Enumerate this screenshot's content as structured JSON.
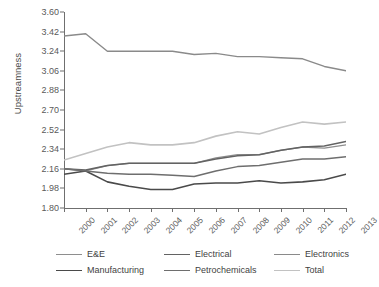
{
  "chart_data": {
    "type": "line",
    "title": "",
    "xlabel": "",
    "ylabel": "Upstreamness",
    "x": [
      2000,
      2001,
      2002,
      2003,
      2004,
      2005,
      2006,
      2007,
      2008,
      2009,
      2010,
      2011,
      2012,
      2013
    ],
    "xtick_labels": [
      "2000",
      "2001",
      "2002",
      "2003",
      "2004",
      "2005",
      "2006",
      "2007",
      "2008",
      "2009",
      "2010",
      "2011",
      "2012",
      "2013"
    ],
    "ytick_labels": [
      "1.80",
      "1.98",
      "2.16",
      "2.34",
      "2.52",
      "2.70",
      "2.88",
      "3.06",
      "3.24",
      "3.42",
      "3.60"
    ],
    "ytick_values": [
      1.8,
      1.98,
      2.16,
      2.34,
      2.52,
      2.7,
      2.88,
      3.06,
      3.24,
      3.42,
      3.6
    ],
    "ylim": [
      1.8,
      3.6
    ],
    "xlim": [
      2000,
      2013
    ],
    "grid": false,
    "legend_position": "bottom",
    "series": [
      {
        "name": "E&E",
        "color": "#8e8e8e",
        "width": 1.3,
        "values": [
          2.16,
          2.14,
          2.19,
          2.21,
          2.21,
          2.21,
          2.21,
          2.26,
          2.29,
          2.29,
          2.33,
          2.36,
          2.35,
          2.38
        ]
      },
      {
        "name": "Electrical",
        "color": "#636363",
        "width": 1.5,
        "values": [
          2.16,
          2.15,
          2.19,
          2.21,
          2.21,
          2.21,
          2.21,
          2.25,
          2.28,
          2.29,
          2.33,
          2.36,
          2.37,
          2.41
        ]
      },
      {
        "name": "Electronics",
        "color": "#8a8a8a",
        "width": 1.4,
        "values": [
          3.38,
          3.4,
          3.24,
          3.24,
          3.24,
          3.24,
          3.21,
          3.22,
          3.19,
          3.19,
          3.18,
          3.17,
          3.1,
          3.06
        ]
      },
      {
        "name": "Manufacturing",
        "color": "#4a4a4a",
        "width": 1.6,
        "values": [
          2.11,
          2.14,
          2.04,
          2.0,
          1.97,
          1.97,
          2.02,
          2.03,
          2.03,
          2.05,
          2.03,
          2.04,
          2.06,
          2.11
        ]
      },
      {
        "name": "Petrochemicals",
        "color": "#6e6e6e",
        "width": 1.5,
        "values": [
          2.16,
          2.14,
          2.12,
          2.11,
          2.11,
          2.1,
          2.09,
          2.14,
          2.18,
          2.19,
          2.22,
          2.25,
          2.25,
          2.27
        ]
      },
      {
        "name": "Total",
        "color": "#c2c2c2",
        "width": 1.6,
        "values": [
          2.24,
          2.3,
          2.36,
          2.4,
          2.38,
          2.38,
          2.4,
          2.46,
          2.5,
          2.48,
          2.54,
          2.59,
          2.57,
          2.59
        ]
      }
    ]
  },
  "legend": {
    "items": [
      {
        "label": "E&E"
      },
      {
        "label": "Electrical"
      },
      {
        "label": "Electronics"
      },
      {
        "label": "Manufacturing"
      },
      {
        "label": "Petrochemicals"
      },
      {
        "label": "Total"
      }
    ]
  }
}
